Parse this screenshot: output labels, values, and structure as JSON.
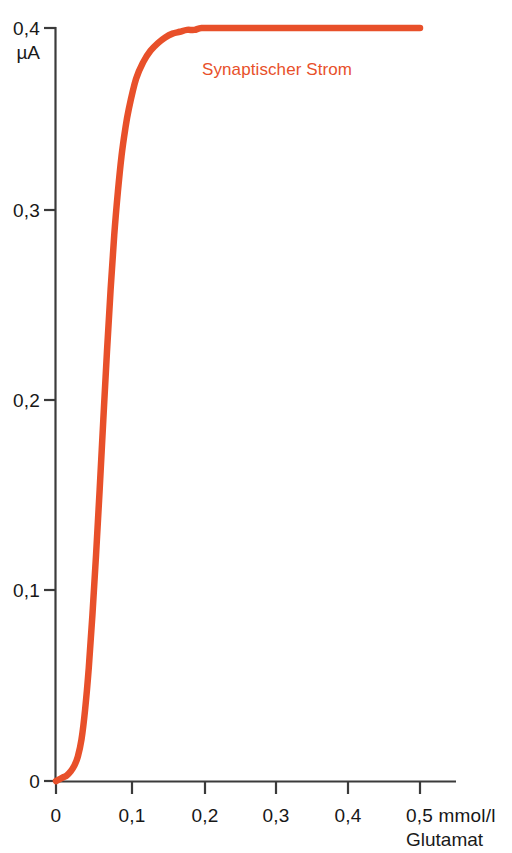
{
  "chart_data": {
    "type": "line",
    "title": "",
    "xlabel": "mmol/l Glutamat",
    "ylabel": "µA",
    "xlim": [
      0,
      0.55
    ],
    "ylim": [
      0,
      0.4
    ],
    "grid": false,
    "legend_position": "inside-top-center",
    "x_unit_primary": "0,5 mmol/l",
    "x_unit_secondary": "Glutamat",
    "y_unit": "µA",
    "y_axis_top_label": "0,4",
    "xticks": [
      {
        "value": 0,
        "label": "0"
      },
      {
        "value": 0.1,
        "label": "0,1"
      },
      {
        "value": 0.2,
        "label": "0,2"
      },
      {
        "value": 0.3,
        "label": "0,3"
      },
      {
        "value": 0.4,
        "label": "0,4"
      },
      {
        "value": 0.5,
        "label": "0,5 mmol/l"
      }
    ],
    "yticks": [
      {
        "value": 0,
        "label": "0"
      },
      {
        "value": 0.1,
        "label": "0,1"
      },
      {
        "value": 0.2,
        "label": "0,2"
      },
      {
        "value": 0.3,
        "label": "0,3"
      },
      {
        "value": 0.4,
        "label": "0,4"
      }
    ],
    "series": [
      {
        "name": "Synaptischer Strom",
        "color": "#E8502A",
        "x": [
          0.0,
          0.005,
          0.01,
          0.015,
          0.02,
          0.025,
          0.03,
          0.035,
          0.04,
          0.045,
          0.05,
          0.055,
          0.06,
          0.065,
          0.07,
          0.075,
          0.08,
          0.085,
          0.09,
          0.095,
          0.1,
          0.11,
          0.12,
          0.13,
          0.14,
          0.15,
          0.16,
          0.17,
          0.18,
          0.19,
          0.2,
          0.22,
          0.24,
          0.26,
          0.28,
          0.3,
          0.34,
          0.38,
          0.42,
          0.46,
          0.5
        ],
        "y": [
          0.0,
          0.001,
          0.002,
          0.003,
          0.005,
          0.008,
          0.013,
          0.022,
          0.038,
          0.06,
          0.088,
          0.12,
          0.155,
          0.192,
          0.228,
          0.261,
          0.29,
          0.313,
          0.332,
          0.346,
          0.357,
          0.373,
          0.382,
          0.388,
          0.392,
          0.395,
          0.397,
          0.398,
          0.399,
          0.399,
          0.4,
          0.4,
          0.4,
          0.4,
          0.4,
          0.4,
          0.4,
          0.4,
          0.4,
          0.4,
          0.4
        ]
      }
    ],
    "annotations": [
      {
        "text": "Synaptischer Strom",
        "x": 0.175,
        "y": 0.365,
        "color": "#E8502A"
      }
    ]
  },
  "labels": {
    "series_label": "Synaptischer Strom",
    "y_top_value": "0,4",
    "y_unit": "µA",
    "y_03": "0,3",
    "y_02": "0,2",
    "y_01": "0,1",
    "y_00": "0",
    "x_00": "0",
    "x_01": "0,1",
    "x_02": "0,2",
    "x_03": "0,3",
    "x_04": "0,4",
    "x_05": "0,5 mmol/l",
    "x_unit_line2": "Glutamat"
  },
  "colors": {
    "curve": "#E8502A",
    "axis": "#3B3B3B",
    "text": "#171717",
    "background": "#FFFFFF"
  }
}
